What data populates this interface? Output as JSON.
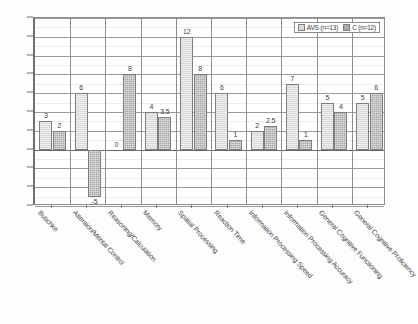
{
  "chart_data": {
    "type": "bar",
    "title": "",
    "xlabel": "",
    "ylabel": "",
    "ylim": [
      -6,
      14
    ],
    "ytick_step": 2,
    "yticks": [
      14,
      12,
      10,
      8,
      6,
      4,
      2,
      0,
      -2,
      -4,
      -6
    ],
    "grid": true,
    "legend_position": "top-right",
    "categories": [
      "Buschke",
      "Attention/Mental Control",
      "Reasoning/Calculation",
      "Memory",
      "Spatial Processing",
      "Reaction Time",
      "Information Processing Speed",
      "Information Processing Accuracy",
      "General Cognitive Functioning",
      "General Cognitive Proficiency"
    ],
    "series": [
      {
        "name": "AVS (n=13)",
        "color": "#d9d9d9",
        "values": [
          3,
          6,
          0,
          4,
          12,
          6,
          2,
          7,
          5,
          5
        ],
        "labels": [
          "3",
          "6",
          "0",
          "4",
          "12",
          "6",
          "2",
          "7",
          "5",
          "5"
        ]
      },
      {
        "name": "C (n=12)",
        "color": "#a9a9a9",
        "values": [
          2,
          -5,
          8,
          3.5,
          8,
          1,
          2.5,
          1,
          4,
          6
        ],
        "labels": [
          "2",
          "-5",
          "8",
          "3.5",
          "8",
          "1",
          "2.5",
          "1",
          "4",
          "6"
        ]
      }
    ]
  },
  "legend": {
    "entries": [
      {
        "label": "AVS (n=13)"
      },
      {
        "label": "C (n=12)"
      }
    ]
  }
}
